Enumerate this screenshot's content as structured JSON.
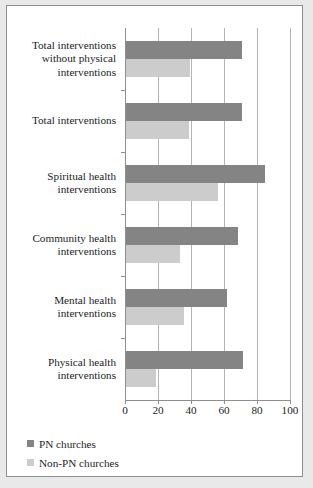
{
  "chart_data": {
    "type": "bar",
    "orientation": "horizontal",
    "title": "",
    "subtitle": "",
    "xlabel": "",
    "ylabel": "",
    "xlim": [
      0,
      100
    ],
    "xticks": [
      0,
      20,
      40,
      60,
      80,
      100
    ],
    "xtick_labels": [
      "0",
      "20",
      "40",
      "60",
      "80",
      "100"
    ],
    "grid": true,
    "legend_position": "bottom-left",
    "categories": [
      "Physical health interventions",
      "Mental health interventions",
      "Community health interventions",
      "Spiritual health interventions",
      "Total interventions",
      "Total interventions without physical interventions"
    ],
    "category_lines": [
      [
        "Physical health",
        "interventions"
      ],
      [
        "Mental health",
        "interventions"
      ],
      [
        "Community health",
        "interventions"
      ],
      [
        "Spiritual health",
        "interventions"
      ],
      [
        "Total interventions"
      ],
      [
        "Total interventions",
        "without physical",
        "interventions"
      ]
    ],
    "series": [
      {
        "name": "PN churches",
        "color": "#848484",
        "values": [
          71,
          61,
          68,
          84,
          70,
          70
        ]
      },
      {
        "name": "Non-PN churches",
        "color": "#cccccc",
        "values": [
          18,
          35,
          33,
          56,
          38,
          39
        ]
      }
    ]
  },
  "legend": {
    "items": [
      {
        "label": "PN churches",
        "swatch": "legend-swatch-pn"
      },
      {
        "label": "Non-PN churches",
        "swatch": "legend-swatch-nonpn"
      }
    ]
  },
  "axis": {
    "tick_labels": [
      "0",
      "20",
      "40",
      "60",
      "80",
      "100"
    ]
  }
}
